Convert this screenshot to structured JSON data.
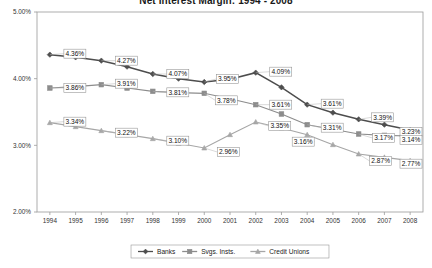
{
  "chart_data": {
    "type": "line",
    "title": "Net Interest Margin:  1994 - 2008",
    "xlabel": "",
    "ylabel": "",
    "ylim": [
      2.0,
      5.0
    ],
    "ytick_labels": [
      "5.00%",
      "4.00%",
      "3.00%",
      "2.00%"
    ],
    "ytick_values": [
      5.0,
      4.0,
      3.0,
      2.0
    ],
    "grid": false,
    "legend_position": "bottom",
    "categories": [
      "1994",
      "1995",
      "1996",
      "1997",
      "1998",
      "1999",
      "2000",
      "2001",
      "2002",
      "2003",
      "2004",
      "2005",
      "2006",
      "2007",
      "2008"
    ],
    "series": [
      {
        "name": "Banks",
        "color": "#4d4d4d",
        "marker": "diamond",
        "values": [
          4.36,
          4.32,
          4.27,
          4.18,
          4.07,
          4.0,
          3.95,
          3.99,
          4.09,
          3.87,
          3.61,
          3.49,
          3.39,
          3.31,
          3.23
        ],
        "labels": [
          {
            "index": 0,
            "text": "4.36%"
          },
          {
            "index": 2,
            "text": "4.27%"
          },
          {
            "index": 4,
            "text": "4.07%"
          },
          {
            "index": 6,
            "text": "3.95%"
          },
          {
            "index": 8,
            "text": "4.09%"
          },
          {
            "index": 10,
            "text": "3.61%"
          },
          {
            "index": 12,
            "text": "3.39%"
          },
          {
            "index": 14,
            "text": "3.23%"
          }
        ]
      },
      {
        "name": "Svgs. Insts.",
        "color": "#8c8c8c",
        "marker": "square",
        "values": [
          3.86,
          3.88,
          3.91,
          3.86,
          3.81,
          3.79,
          3.78,
          3.7,
          3.61,
          3.47,
          3.31,
          3.24,
          3.17,
          3.15,
          3.14
        ],
        "labels": [
          {
            "index": 0,
            "text": "3.86%"
          },
          {
            "index": 2,
            "text": "3.91%"
          },
          {
            "index": 4,
            "text": "3.81%"
          },
          {
            "index": 6,
            "text": "3.78%"
          },
          {
            "index": 8,
            "text": "3.61%"
          },
          {
            "index": 10,
            "text": "3.31%"
          },
          {
            "index": 12,
            "text": "3.17%"
          },
          {
            "index": 14,
            "text": "3.14%"
          }
        ]
      },
      {
        "name": "Credit Unions",
        "color": "#a6a6a6",
        "marker": "triangle",
        "values": [
          3.34,
          3.28,
          3.22,
          3.16,
          3.1,
          3.03,
          2.96,
          3.16,
          3.35,
          3.26,
          3.16,
          3.01,
          2.87,
          2.82,
          2.77
        ],
        "labels": [
          {
            "index": 0,
            "text": "3.34%"
          },
          {
            "index": 2,
            "text": "3.22%"
          },
          {
            "index": 4,
            "text": "3.10%"
          },
          {
            "index": 6,
            "text": "2.96%"
          },
          {
            "index": 8,
            "text": "3.35%"
          },
          {
            "index": 10,
            "text": "3.16%"
          },
          {
            "index": 12,
            "text": "2.87%"
          },
          {
            "index": 14,
            "text": "2.77%"
          }
        ]
      }
    ]
  }
}
